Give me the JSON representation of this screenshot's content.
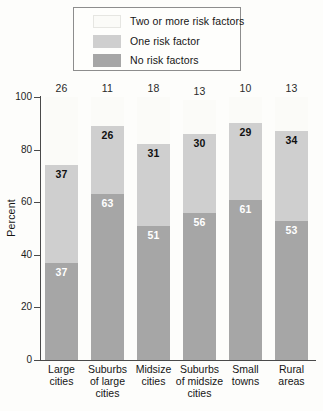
{
  "chart_data": {
    "type": "bar",
    "subtype": "stacked-percent",
    "title": "",
    "xlabel": "",
    "ylabel": "Percent",
    "ylim": [
      0,
      100
    ],
    "yticks": [
      0,
      20,
      40,
      60,
      80,
      100
    ],
    "grid": false,
    "legend_position": "top",
    "categories": [
      "Large cities",
      "Suburbs of large cities",
      "Midsize cities",
      "Suburbs of midsize cities",
      "Small towns",
      "Rural areas"
    ],
    "series": [
      {
        "name": "Two or more risk factors",
        "color": "#fbfbf8",
        "values": [
          26,
          11,
          18,
          13,
          10,
          13
        ]
      },
      {
        "name": "One risk factor",
        "color": "#cfcfcf",
        "values": [
          37,
          26,
          31,
          30,
          29,
          34
        ]
      },
      {
        "name": "No risk factors",
        "color": "#a6a6a6",
        "values": [
          37,
          63,
          51,
          56,
          61,
          53
        ]
      }
    ]
  },
  "legend": {
    "items": [
      {
        "label": "Two or more risk factors",
        "color": "#fbfbf8"
      },
      {
        "label": "One risk factor",
        "color": "#cfcfcf"
      },
      {
        "label": "No risk factors",
        "color": "#a6a6a6"
      }
    ]
  },
  "axis": {
    "y_title": "Percent",
    "y_ticks": [
      "100",
      "80",
      "60",
      "40",
      "20",
      "0"
    ]
  },
  "categories_display": [
    "Large\ncities",
    "Suburbs\nof large\ncities",
    "Midsize\ncities",
    "Suburbs\nof midsize\ncities",
    "Small\ntowns",
    "Rural\nareas"
  ]
}
